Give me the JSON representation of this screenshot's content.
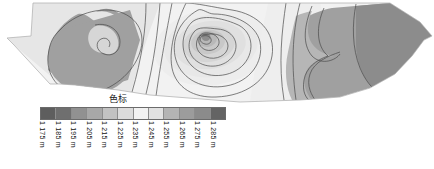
{
  "figure": {
    "type": "contour-map",
    "background_color": "#ffffff",
    "contour_line_color": "#4a4a4a",
    "outline_color": "#9a9a9a"
  },
  "legend": {
    "title": "色标",
    "unit": "m",
    "swatch_count": 12,
    "swatches": [
      {
        "label": "1 175 m",
        "value": 1175,
        "color": "#5e5e5e"
      },
      {
        "label": "1 185 m",
        "value": 1185,
        "color": "#6f6f6f"
      },
      {
        "label": "1 195 m",
        "value": 1195,
        "color": "#919191"
      },
      {
        "label": "1 205 m",
        "value": 1205,
        "color": "#a8a8a8"
      },
      {
        "label": "1 215 m",
        "value": 1215,
        "color": "#c2c2c2"
      },
      {
        "label": "1 225 m",
        "value": 1225,
        "color": "#dcdcdc"
      },
      {
        "label": "1 235 m",
        "value": 1235,
        "color": "#f2f2f2"
      },
      {
        "label": "1 245 m",
        "value": 1245,
        "color": "#e2e2e2"
      },
      {
        "label": "1 255 m",
        "value": 1255,
        "color": "#b4b4b4"
      },
      {
        "label": "1 265 m",
        "value": 1265,
        "color": "#9c9c9c"
      },
      {
        "label": "1 275 m",
        "value": 1275,
        "color": "#8b8b8b"
      },
      {
        "label": "1 285 m",
        "value": 1285,
        "color": "#646464"
      }
    ]
  },
  "chart_data": {
    "type": "heatmap",
    "title": "",
    "subtitle": "",
    "xlabel": "",
    "ylabel": "",
    "legend_title": "色标",
    "legend_position": "bottom-left",
    "grid": false,
    "colormap": "grayscale",
    "levels": [
      1175,
      1185,
      1195,
      1205,
      1215,
      1225,
      1235,
      1245,
      1255,
      1265,
      1275,
      1285
    ],
    "level_unit": "m",
    "level_step": 10,
    "zlim": [
      1175,
      1285
    ],
    "annotations": [
      {
        "name": "northwest-low-zone",
        "level": 1195,
        "description": "large dark lobe, left of map"
      },
      {
        "name": "central-peak",
        "level": 1235,
        "description": "concentric closed contours forming a bullseye high"
      },
      {
        "name": "east-high-zone",
        "level": 1275,
        "description": "dark region along right edge"
      }
    ]
  }
}
